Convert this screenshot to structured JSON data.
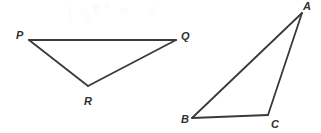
{
  "figure": {
    "canvas": {
      "width": 321,
      "height": 133
    },
    "style": {
      "background_color": "#ffffff",
      "stroke_color": "#3a3a3a",
      "stroke_width": 1.8,
      "label_color": "#2f2f2f",
      "label_font_size": 11
    },
    "shapes": [
      {
        "name": "triangle-pqr",
        "kind": "triangle",
        "vertices": [
          {
            "label": "P",
            "x": 29,
            "y": 40,
            "label_x": 16,
            "label_y": 30
          },
          {
            "label": "Q",
            "x": 176,
            "y": 40,
            "label_x": 181,
            "label_y": 31
          },
          {
            "label": "R",
            "x": 88,
            "y": 86,
            "label_x": 84,
            "label_y": 96
          }
        ],
        "edges": [
          {
            "name": "edge-PQ",
            "from": "P",
            "to": "Q"
          },
          {
            "name": "edge-QR",
            "from": "Q",
            "to": "R"
          },
          {
            "name": "edge-RP",
            "from": "R",
            "to": "P"
          }
        ]
      },
      {
        "name": "triangle-abc",
        "kind": "triangle",
        "vertices": [
          {
            "label": "A",
            "x": 302,
            "y": 13,
            "label_x": 303,
            "label_y": 1
          },
          {
            "label": "B",
            "x": 192,
            "y": 118,
            "label_x": 181,
            "label_y": 114
          },
          {
            "label": "C",
            "x": 268,
            "y": 115,
            "label_x": 271,
            "label_y": 119
          }
        ],
        "edges": [
          {
            "name": "edge-AB",
            "from": "A",
            "to": "B"
          },
          {
            "name": "edge-BC",
            "from": "B",
            "to": "C"
          },
          {
            "name": "edge-CA",
            "from": "C",
            "to": "A"
          }
        ]
      }
    ],
    "specks": [
      {
        "x": 68,
        "y": 6,
        "w": 3,
        "h": 9
      },
      {
        "x": 80,
        "y": 9,
        "w": 9,
        "h": 7
      },
      {
        "x": 92,
        "y": 3,
        "w": 8,
        "h": 12
      },
      {
        "x": 86,
        "y": 14,
        "w": 5,
        "h": 8
      },
      {
        "x": 104,
        "y": 2,
        "w": 6,
        "h": 6
      },
      {
        "x": 120,
        "y": 8,
        "w": 9,
        "h": 5
      },
      {
        "x": 150,
        "y": 6,
        "w": 5,
        "h": 7
      },
      {
        "x": 69,
        "y": 19,
        "w": 3,
        "h": 6
      }
    ]
  }
}
